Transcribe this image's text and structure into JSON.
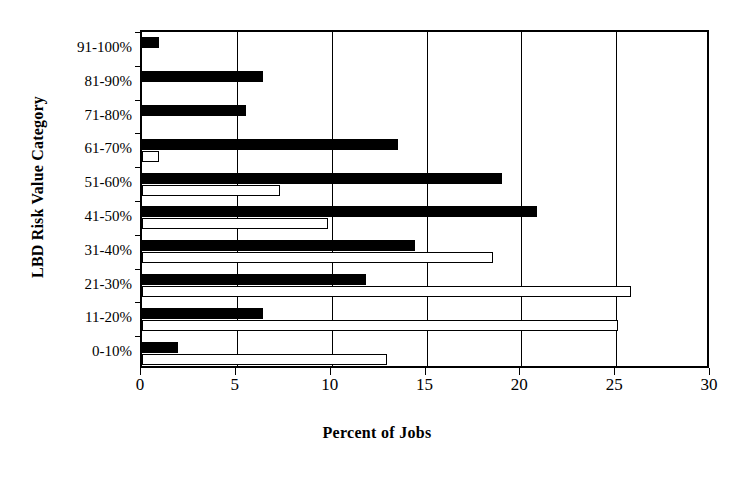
{
  "chart_data": {
    "type": "bar",
    "orientation": "horizontal",
    "title": "",
    "xlabel": "Percent of Jobs",
    "ylabel": "LBD Risk Value Category",
    "categories": [
      "0-10%",
      "11-20%",
      "21-30%",
      "31-40%",
      "41-50%",
      "51-60%",
      "61-70%",
      "71-80%",
      "81-90%",
      "91-100%"
    ],
    "xlim": [
      0,
      30
    ],
    "xticks": [
      0,
      5,
      10,
      15,
      20,
      25,
      30
    ],
    "xtick_labels": [
      "0",
      "5",
      "10",
      "15",
      "20",
      "25",
      "30"
    ],
    "grid": "vertical",
    "legend": "none",
    "series": [
      {
        "name": "solid-series",
        "style": "filled-black",
        "color": "#000000",
        "values": [
          1.9,
          6.4,
          11.8,
          14.4,
          20.8,
          19.0,
          13.5,
          5.5,
          6.4,
          0.9
        ]
      },
      {
        "name": "hollow-series",
        "style": "open-white",
        "color": "#ffffff",
        "values": [
          12.9,
          25.1,
          25.8,
          18.5,
          9.8,
          7.3,
          0.9,
          0.0,
          0.0,
          0.0
        ]
      }
    ]
  },
  "axis": {
    "x_title": "Percent of Jobs",
    "y_title": "LBD Risk Value Category"
  }
}
